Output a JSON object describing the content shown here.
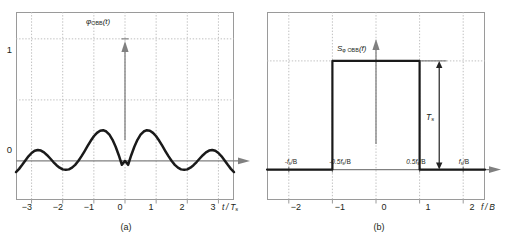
{
  "figure": {
    "background": "#ffffff",
    "curve_color": "#1a1a1a",
    "axis_color": "#808080",
    "frame_color": "#9a9a9a",
    "grid_color": "#b9b9b9"
  },
  "panel_a": {
    "caption": "(a)",
    "curve_label_main": "φ",
    "curve_label_sub": "OBB",
    "curve_label_arg": "(t)",
    "xaxis_label_num": "t",
    "xaxis_label_den": "T",
    "xaxis_label_den_sub": "s",
    "xticks": [
      "−3",
      "−2",
      "−1",
      "0",
      "1",
      "2",
      "3"
    ],
    "yticks": [
      "1",
      "0"
    ]
  },
  "panel_b": {
    "caption": "(b)",
    "curve_label_main": "S",
    "curve_label_sub": "φ OBB",
    "curve_label_arg": "(f)",
    "xaxis_label_num": "f",
    "xaxis_label_den": "B",
    "xticks": [
      "−2",
      "−1",
      "0",
      "1",
      "2"
    ],
    "freq_ticks": [
      "-f",
      "-0.5f",
      "0.5f",
      "f"
    ],
    "freq_tick_sub": "s",
    "freq_tick_suffix": "/B",
    "amplitude_label_main": "T",
    "amplitude_label_sub": "s"
  },
  "chart_data": [
    {
      "type": "line",
      "panel": "a",
      "title": "",
      "xlabel": "t / T_s",
      "ylabel": "",
      "function": "sinc(t/T_s)",
      "xlim": [
        -3.5,
        3.5
      ],
      "ylim": [
        -0.32,
        1.22
      ],
      "xticks": [
        -3,
        -2,
        -1,
        0,
        1,
        2,
        3
      ],
      "yticks": [
        0,
        0.5,
        1
      ],
      "ytick_labels": [
        "0",
        "",
        "1"
      ],
      "grid": true,
      "legend": null,
      "x": [
        -3.5,
        -3.4,
        -3.3,
        -3.2,
        -3.1,
        -3.0,
        -2.9,
        -2.8,
        -2.7,
        -2.6,
        -2.5,
        -2.4,
        -2.3,
        -2.2,
        -2.1,
        -2.0,
        -1.9,
        -1.8,
        -1.7,
        -1.6,
        -1.5,
        -1.4,
        -1.3,
        -1.2,
        -1.1,
        -1.0,
        -0.9,
        -0.8,
        -0.7,
        -0.6,
        -0.5,
        -0.4,
        -0.3,
        -0.2,
        -0.1,
        0.0,
        0.1,
        0.2,
        0.3,
        0.4,
        0.5,
        0.6,
        0.7,
        0.8,
        0.9,
        1.0,
        1.1,
        1.2,
        1.3,
        1.4,
        1.5,
        1.6,
        1.7,
        1.8,
        1.9,
        2.0,
        2.1,
        2.2,
        2.3,
        2.4,
        2.5,
        2.6,
        2.7,
        2.8,
        2.9,
        3.0,
        3.1,
        3.2,
        3.3,
        3.4,
        3.5
      ],
      "y": [
        -0.091,
        -0.065,
        -0.032,
        0.004,
        0.038,
        0.065,
        0.083,
        0.09,
        0.085,
        0.07,
        0.047,
        0.02,
        -0.009,
        -0.035,
        -0.055,
        -0.069,
        -0.073,
        -0.069,
        -0.055,
        -0.032,
        -0.001,
        0.037,
        0.079,
        0.123,
        0.165,
        0.202,
        0.23,
        0.247,
        0.252,
        0.241,
        0.215,
        0.173,
        0.116,
        0.047,
        -0.032,
        0.0,
        -0.032,
        0.047,
        0.116,
        0.173,
        0.215,
        0.241,
        0.252,
        0.247,
        0.23,
        0.202,
        0.165,
        0.123,
        0.079,
        0.037,
        -0.001,
        -0.032,
        -0.055,
        -0.069,
        -0.073,
        -0.069,
        -0.055,
        -0.035,
        -0.009,
        0.02,
        0.047,
        0.07,
        0.085,
        0.09,
        0.083,
        0.065,
        0.038,
        0.004,
        -0.032,
        -0.065,
        -0.091
      ],
      "note": "main lobe peaks at y=1 at t=0; zero crossings at every nonzero integer"
    },
    {
      "type": "line",
      "panel": "b",
      "title": "",
      "xlabel": "f / B",
      "ylabel": "",
      "function": "rect(f/(2B)) amplitude T_s",
      "xlim": [
        -2.5,
        2.5
      ],
      "ylim": [
        -0.28,
        1.45
      ],
      "xticks": [
        -2,
        -1,
        0,
        1,
        2
      ],
      "secondary_xticks": [
        -2,
        -1,
        1,
        2
      ],
      "secondary_xtick_labels": [
        "-f_s/B",
        "-0.5f_s/B",
        "0.5f_s/B",
        "f_s/B"
      ],
      "grid": true,
      "legend": null,
      "x": [
        -2.5,
        -1.0,
        -1.0,
        1.0,
        1.0,
        2.5
      ],
      "y": [
        0,
        0,
        1,
        1,
        0,
        0
      ],
      "amplitude": 1.0,
      "amplitude_label": "T_s",
      "note": "ideal rectangular spectrum of height T_s between f/B = -1 and +1"
    }
  ]
}
